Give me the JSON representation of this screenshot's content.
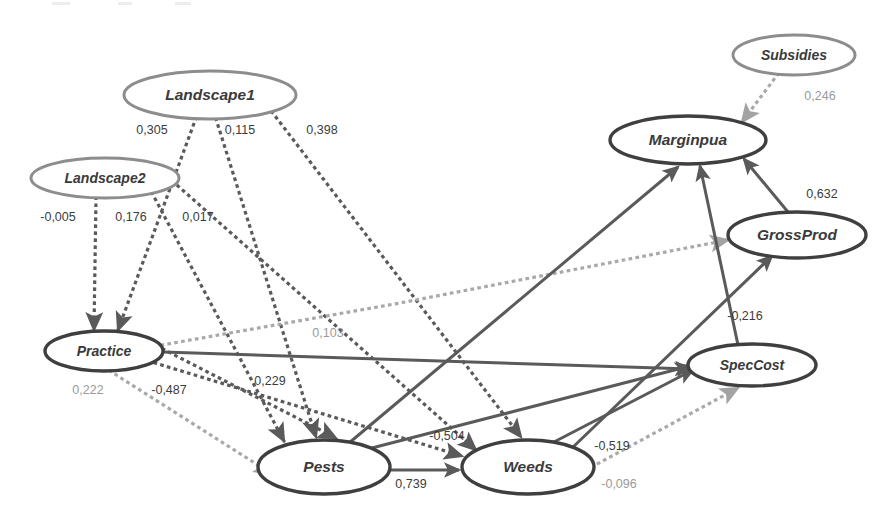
{
  "diagram": {
    "type": "path-diagram",
    "title": "",
    "nodes": [
      {
        "id": "landscape1",
        "label": "Landscape1",
        "style": "light",
        "cx": 210,
        "cy": 95,
        "rx": 86,
        "ry": 24
      },
      {
        "id": "landscape2",
        "label": "Landscape2",
        "style": "light",
        "cx": 105,
        "cy": 178,
        "rx": 74,
        "ry": 20
      },
      {
        "id": "subsidies",
        "label": "Subsidies",
        "style": "light",
        "cx": 794,
        "cy": 55,
        "rx": 61,
        "ry": 20
      },
      {
        "id": "marginpua",
        "label": "Marginpua",
        "style": "dark",
        "cx": 688,
        "cy": 140,
        "rx": 78,
        "ry": 24
      },
      {
        "id": "grossprod",
        "label": "GrossProd",
        "style": "dark",
        "cx": 797,
        "cy": 235,
        "rx": 69,
        "ry": 23
      },
      {
        "id": "speccost",
        "label": "SpecCost",
        "style": "dark",
        "cx": 752,
        "cy": 365,
        "rx": 64,
        "ry": 21
      },
      {
        "id": "practice",
        "label": "Practice",
        "style": "dark",
        "cx": 104,
        "cy": 351,
        "rx": 59,
        "ry": 20
      },
      {
        "id": "pests",
        "label": "Pests",
        "style": "dark",
        "cx": 324,
        "cy": 467,
        "rx": 66,
        "ry": 27
      },
      {
        "id": "weeds",
        "label": "Weeds",
        "style": "dark",
        "cx": 528,
        "cy": 467,
        "rx": 66,
        "ry": 27
      }
    ],
    "edges": [
      {
        "id": "l1-practice",
        "from": "Landscape1",
        "to": "Practice",
        "coefficient": "0,305",
        "style": "dotted-dark",
        "label_x": 152,
        "label_y": 131,
        "label_tone": "dark"
      },
      {
        "id": "l1-pests",
        "from": "Landscape1",
        "to": "Pests",
        "coefficient": "0,115",
        "style": "dotted-dark",
        "label_x": 240,
        "label_y": 131,
        "label_tone": "dark"
      },
      {
        "id": "l1-weeds",
        "from": "Landscape1",
        "to": "Weeds",
        "coefficient": "0,398",
        "style": "dotted-dark",
        "label_x": 322,
        "label_y": 131,
        "label_tone": "dark"
      },
      {
        "id": "l2-practice",
        "from": "Landscape2",
        "to": "Practice",
        "coefficient": "-0,005",
        "style": "dotted-dark",
        "label_x": 58,
        "label_y": 218,
        "label_tone": "dark"
      },
      {
        "id": "l2-pests",
        "from": "Landscape2",
        "to": "Pests",
        "coefficient": "0,176",
        "style": "dotted-dark",
        "label_x": 131,
        "label_y": 218,
        "label_tone": "dark"
      },
      {
        "id": "l2-weeds",
        "from": "Landscape2",
        "to": "Weeds",
        "coefficient": "0,017",
        "style": "dotted-dark",
        "label_x": 198,
        "label_y": 218,
        "label_tone": "dark"
      },
      {
        "id": "practice-grossprod",
        "from": "Practice",
        "to": "GrossProd",
        "coefficient": "0,103",
        "style": "dotted-light",
        "label_x": 328,
        "label_y": 334,
        "label_tone": "light"
      },
      {
        "id": "practice-speccost",
        "from": "Practice",
        "to": "SpecCost",
        "coefficient": "",
        "style": "solid",
        "label_x": 0,
        "label_y": 0,
        "label_tone": "dark"
      },
      {
        "id": "practice-pests",
        "from": "Practice",
        "to": "Pests",
        "coefficient": "0,222",
        "style": "dotted-light",
        "label_x": 88,
        "label_y": 391,
        "label_tone": "light"
      },
      {
        "id": "practice-weeds",
        "from": "Practice",
        "to": "Weeds",
        "coefficient": "-0,487",
        "style": "dotted-dark",
        "label_x": 169,
        "label_y": 391,
        "label_tone": "dark"
      },
      {
        "id": "practice-pests2",
        "from": "Practice",
        "to": "Pests",
        "coefficient": "0,229",
        "style": "dotted-dark",
        "label_x": 270,
        "label_y": 382,
        "label_tone": "dark"
      },
      {
        "id": "pests-weeds",
        "from": "Pests",
        "to": "Weeds",
        "coefficient": "0,739",
        "style": "solid",
        "label_x": 411,
        "label_y": 485,
        "label_tone": "dark"
      },
      {
        "id": "pests-marginpua",
        "from": "Pests",
        "to": "Marginpua",
        "coefficient": "-0,504",
        "style": "solid",
        "label_x": 447,
        "label_y": 437,
        "label_tone": "dark"
      },
      {
        "id": "weeds-grossprod",
        "from": "Weeds",
        "to": "GrossProd",
        "coefficient": "-0,519",
        "style": "solid",
        "label_x": 612,
        "label_y": 447,
        "label_tone": "dark"
      },
      {
        "id": "weeds-speccost",
        "from": "Weeds",
        "to": "SpecCost",
        "coefficient": "-0,096",
        "style": "dotted-light",
        "label_x": 619,
        "label_y": 485,
        "label_tone": "light"
      },
      {
        "id": "speccost-marginpua",
        "from": "SpecCost",
        "to": "Marginpua",
        "coefficient": "-0,216",
        "style": "solid",
        "label_x": 745,
        "label_y": 317,
        "label_tone": "dark"
      },
      {
        "id": "grossprod-marginpua",
        "from": "GrossProd",
        "to": "Marginpua",
        "coefficient": "0,632",
        "style": "solid",
        "label_x": 822,
        "label_y": 195,
        "label_tone": "dark"
      },
      {
        "id": "subsidies-marginpua",
        "from": "Subsidies",
        "to": "Marginpua",
        "coefficient": "0,246",
        "style": "dotted-light",
        "label_x": 820,
        "label_y": 97,
        "label_tone": "light"
      }
    ],
    "colors": {
      "node_dark_stroke": "#3f3f3f",
      "node_light_stroke": "#8d8d8d",
      "edge_solid": "#5a5a5a",
      "edge_dotted_dark": "#5a5a5a",
      "edge_dotted_light": "#a9a9a9",
      "label_dark": "#3c3c3c",
      "label_light": "#9a9a9a",
      "background": "#ffffff"
    }
  }
}
